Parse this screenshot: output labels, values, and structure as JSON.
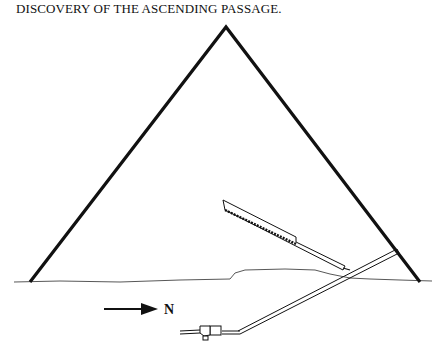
{
  "title": "DISCOVERY OF THE ASCENDING PASSAGE.",
  "diagram": {
    "elements": [
      "pyramid-outline",
      "ground-line",
      "grand-gallery",
      "ascending-passage",
      "descending-passage",
      "subterranean-chamber",
      "north-arrow"
    ]
  },
  "compass": {
    "label": "N",
    "direction": "north",
    "icon": "arrow-right-icon"
  },
  "colors": {
    "ink": "#111111",
    "background": "#ffffff"
  }
}
